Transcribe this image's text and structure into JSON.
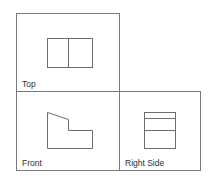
{
  "diagram": {
    "type": "orthographic-projection",
    "colors": {
      "frame": "#7a7a7a",
      "shape": "#6e6e6e",
      "label": "#2e2e2e",
      "background": "#ffffff"
    },
    "views": [
      {
        "id": "top",
        "label": "Top"
      },
      {
        "id": "front",
        "label": "Front"
      },
      {
        "id": "right-side",
        "label": "Right Side"
      }
    ]
  }
}
